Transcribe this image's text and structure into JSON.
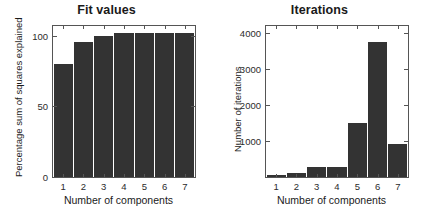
{
  "figure": {
    "background": "#ffffff",
    "bar_color": "#333333",
    "axis_color": "#555555"
  },
  "chart_data": [
    {
      "type": "bar",
      "title": "Fit values",
      "xlabel": "Number of components",
      "ylabel": "Percentage sum of squares explained",
      "categories": [
        "1",
        "2",
        "3",
        "4",
        "5",
        "6",
        "7"
      ],
      "values": [
        80,
        96,
        100,
        102,
        102,
        102,
        102
      ],
      "ylim": [
        0,
        107
      ],
      "yticks": [
        0,
        50,
        100
      ],
      "ytick_labels": [
        "0",
        "50",
        "100"
      ],
      "xtick_labels": [
        "1",
        "2",
        "3",
        "4",
        "5",
        "6",
        "7"
      ],
      "grid": false,
      "legend": null,
      "bar_color": "#333333"
    },
    {
      "type": "bar",
      "title": "Iterations",
      "xlabel": "Number of components",
      "ylabel": "Number of iterations",
      "categories": [
        "1",
        "2",
        "3",
        "4",
        "5",
        "6",
        "7"
      ],
      "values": [
        60,
        120,
        280,
        280,
        1500,
        3750,
        930
      ],
      "ylim": [
        0,
        4200
      ],
      "yticks": [
        1000,
        2000,
        3000,
        4000
      ],
      "ytick_labels": [
        "1000",
        "2000",
        "3000",
        "4000"
      ],
      "xtick_labels": [
        "1",
        "2",
        "3",
        "4",
        "5",
        "6",
        "7"
      ],
      "grid": false,
      "legend": null,
      "bar_color": "#333333"
    }
  ]
}
